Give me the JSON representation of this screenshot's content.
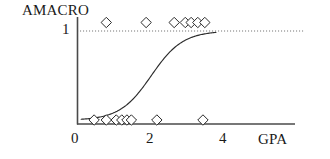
{
  "chart_data": {
    "type": "scatter",
    "title": "AMACRO",
    "xlabel": "GPA",
    "ylabel": "AMACRO",
    "xlim": [
      0,
      4.4
    ],
    "ylim": [
      0,
      1.18
    ],
    "grid": false,
    "legend": null,
    "x_ticks": [
      "0",
      "2",
      "4"
    ],
    "x_tick_values": [
      0,
      2,
      4
    ],
    "y_ticks": [
      "1"
    ],
    "y_tick_values": [
      1
    ],
    "reference_line": {
      "y": 1,
      "style": "dotted",
      "label": "1"
    },
    "series": [
      {
        "name": "AMACRO = 1",
        "marker": "diamond",
        "x": [
          0.78,
          1.86,
          2.62,
          2.92,
          3.08,
          3.26,
          3.45
        ],
        "y": [
          1,
          1,
          1,
          1,
          1,
          1,
          1
        ]
      },
      {
        "name": "AMACRO = 0",
        "marker": "diamond",
        "x": [
          0.45,
          0.78,
          1.05,
          1.2,
          1.34,
          1.46,
          2.15,
          3.4
        ],
        "y": [
          0,
          0,
          0,
          0,
          0,
          0,
          0,
          0
        ]
      }
    ],
    "fit_curve": {
      "name": "logistic fit",
      "type": "logistic",
      "midpoint_x": 2.0,
      "x_start": 0.1,
      "x_end": 3.75,
      "y_min": 0.04,
      "y_max": 1.0
    },
    "colors": {
      "line": "#2b2b2b",
      "marker": "#2b2b2b",
      "axis": "#555555",
      "reference": "#777777"
    }
  },
  "labels": {
    "title": "AMACRO",
    "ytick_1": "1",
    "xtick_0": "0",
    "xtick_2": "2",
    "xtick_4": "4",
    "xaxis_title": "GPA"
  }
}
